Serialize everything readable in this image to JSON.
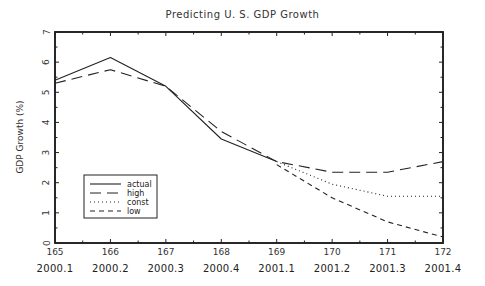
{
  "chart_data": {
    "type": "line",
    "title": "Predicting U. S. GDP Growth",
    "xlabel": "",
    "ylabel": "GDP Growth (%)",
    "x": [
      165,
      166,
      167,
      168,
      169,
      170,
      171,
      172
    ],
    "x_secondary_labels": [
      "2000.1",
      "2000.2",
      "2000.3",
      "2000.4",
      "2001.1",
      "2001.2",
      "2001.3",
      "2001.4"
    ],
    "xlim": [
      165,
      172
    ],
    "ylim": [
      0,
      7
    ],
    "yticks": [
      0,
      1,
      2,
      3,
      4,
      5,
      6,
      7
    ],
    "grid": false,
    "legend_position": "lower left",
    "series": [
      {
        "name": "actual",
        "style": "solid",
        "x": [
          165,
          166,
          167,
          168,
          169
        ],
        "values": [
          5.4,
          6.15,
          5.2,
          3.45,
          2.7
        ]
      },
      {
        "name": "high",
        "style": "long-dash",
        "x": [
          165,
          166,
          167,
          168,
          169,
          170,
          171,
          172
        ],
        "values": [
          5.3,
          5.75,
          5.2,
          3.7,
          2.7,
          2.35,
          2.35,
          2.7
        ]
      },
      {
        "name": "const",
        "style": "dotted",
        "x": [
          169,
          170,
          171,
          172
        ],
        "values": [
          2.7,
          1.95,
          1.55,
          1.55
        ]
      },
      {
        "name": "low",
        "style": "short-dash",
        "x": [
          169,
          170,
          171,
          172
        ],
        "values": [
          2.6,
          1.5,
          0.7,
          0.2
        ]
      }
    ]
  },
  "legend": {
    "items": [
      {
        "label": "actual"
      },
      {
        "label": "high"
      },
      {
        "label": "const"
      },
      {
        "label": "low"
      }
    ]
  }
}
